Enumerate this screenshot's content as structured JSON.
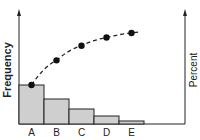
{
  "chart_data": {
    "type": "bar",
    "subtype": "pareto",
    "title": "",
    "categories": [
      "A",
      "B",
      "C",
      "D",
      "E"
    ],
    "series": [
      {
        "name": "Frequency",
        "type": "bar",
        "values": [
          39,
          25,
          15,
          8,
          3
        ]
      },
      {
        "name": "Cumulative Percent",
        "type": "line",
        "style": "dashed",
        "marker": "circle",
        "values": [
          43,
          70,
          86,
          95,
          100
        ]
      }
    ],
    "xlabel": "",
    "ylabel": "Frequency",
    "y2label": "Percent",
    "grid": false,
    "legend": "none",
    "colors": {
      "bar_fill": "#cfcfcf",
      "stroke": "#222222",
      "points": "#111111"
    }
  },
  "labels": {
    "ylabel": "Frequency",
    "y2label": "Percent",
    "categories": [
      "A",
      "B",
      "C",
      "D",
      "E"
    ]
  }
}
